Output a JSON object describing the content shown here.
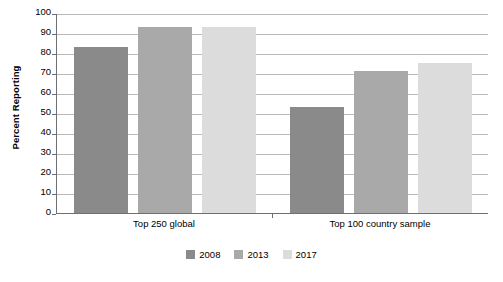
{
  "chart_data": {
    "type": "bar",
    "title": "",
    "subtitle": "",
    "xlabel": "",
    "ylabel": "Percent Reporting",
    "ylim": [
      0,
      100
    ],
    "yticks": [
      0,
      10,
      20,
      30,
      40,
      50,
      60,
      70,
      80,
      90,
      100
    ],
    "ytick_labels": [
      "0",
      "10",
      "20",
      "30",
      "40",
      "50",
      "60",
      "70",
      "80",
      "90",
      "100"
    ],
    "grid": "horizontal",
    "legend_position": "bottom-center",
    "categories": [
      "Top 250 global",
      "Top 100 country sample"
    ],
    "series": [
      {
        "name": "2008",
        "color": "#8a8a8a",
        "values": [
          83,
          53
        ]
      },
      {
        "name": "2013",
        "color": "#a9a9a9",
        "values": [
          93,
          71
        ]
      },
      {
        "name": "2017",
        "color": "#dcdcdc",
        "values": [
          93,
          75
        ]
      }
    ]
  },
  "legend": {
    "items": [
      {
        "label": "2008",
        "color": "#8a8a8a"
      },
      {
        "label": "2013",
        "color": "#a9a9a9"
      },
      {
        "label": "2017",
        "color": "#dcdcdc"
      }
    ]
  },
  "axes": {
    "y_title": "Percent Reporting",
    "axis_color": "#6f6f6f",
    "grid_color": "#b9b9b9"
  }
}
